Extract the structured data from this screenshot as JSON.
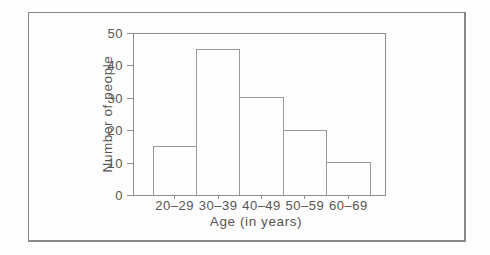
{
  "figure": {
    "kind": "scanned-textbook-histogram",
    "colors": {
      "background": "#fdfdfd",
      "frame_border": "#888888",
      "axis_line": "#8f8f8f",
      "bar_fill": "#fefefe",
      "bar_outline": "#9a9a9a",
      "text": "#565656"
    }
  },
  "chart_data": {
    "type": "bar",
    "subtype": "histogram",
    "title": "",
    "categories": [
      "20–29",
      "30–39",
      "40–49",
      "50–59",
      "60–69"
    ],
    "values": [
      15,
      45,
      30,
      20,
      10
    ],
    "xlabel": "Age (in years)",
    "ylabel": "Number of people",
    "ylim": [
      0,
      50
    ],
    "yticks": [
      0,
      10,
      20,
      30,
      40,
      50
    ],
    "grid": false,
    "legend": "none",
    "bars_adjacent": true,
    "plot_box": true
  }
}
